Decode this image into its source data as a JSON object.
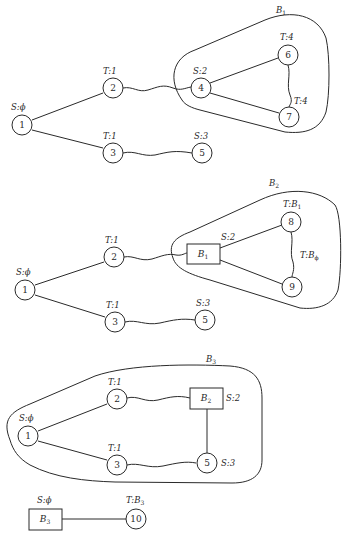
{
  "panels": [
    {
      "id": "panel-1",
      "blossom_label": "B",
      "blossom_sub": "1",
      "nodes": [
        {
          "id": "1",
          "label": "S:ϕ"
        },
        {
          "id": "2",
          "label": "T:1"
        },
        {
          "id": "3",
          "label": "T:1"
        },
        {
          "id": "4",
          "label": "S:2"
        },
        {
          "id": "5",
          "label": "S:3"
        },
        {
          "id": "6",
          "label": "T:4"
        },
        {
          "id": "7",
          "label": "T:4"
        }
      ]
    },
    {
      "id": "panel-2",
      "blossom_label": "B",
      "blossom_sub": "2",
      "nodes": [
        {
          "id": "1",
          "label": "S:ϕ"
        },
        {
          "id": "2",
          "label": "T:1"
        },
        {
          "id": "3",
          "label": "T:1"
        },
        {
          "id": "B1",
          "label": "S:2",
          "box_text": "B",
          "box_sub": "1"
        },
        {
          "id": "5",
          "label": "S:3"
        },
        {
          "id": "8",
          "label": "T:",
          "label_b": "B",
          "label_sub": "1"
        },
        {
          "id": "9",
          "label": ""
        }
      ],
      "edge_label": {
        "text": "T:",
        "b": "B",
        "sub": "ϕ"
      }
    },
    {
      "id": "panel-3",
      "blossom_label": "B",
      "blossom_sub": "3",
      "nodes": [
        {
          "id": "1",
          "label": "S:ϕ"
        },
        {
          "id": "2",
          "label": "T:1"
        },
        {
          "id": "3",
          "label": "T:1"
        },
        {
          "id": "B2",
          "label": "S:2",
          "box_text": "B",
          "box_sub": "2"
        },
        {
          "id": "5",
          "label": "S:3"
        }
      ]
    },
    {
      "id": "panel-4",
      "nodes": [
        {
          "id": "B3",
          "label": "S:ϕ",
          "box_text": "B",
          "box_sub": "3"
        },
        {
          "id": "10",
          "label": "T:",
          "label_b": "B",
          "label_sub": "3"
        }
      ]
    }
  ]
}
